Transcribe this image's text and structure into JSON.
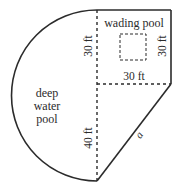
{
  "diagram": {
    "regions": {
      "deep_pool": [
        "deep",
        "water",
        "pool"
      ],
      "wading_pool": "wading pool"
    },
    "dimensions": {
      "upper_left_vertical": "30 ft",
      "right_vertical": "30 ft",
      "horizontal": "30 ft",
      "lower_vertical": "40 ft",
      "diagonal": "a"
    },
    "colors": {
      "line": "#2b2b2b",
      "text": "#2b2b2b",
      "background": "#ffffff"
    }
  }
}
